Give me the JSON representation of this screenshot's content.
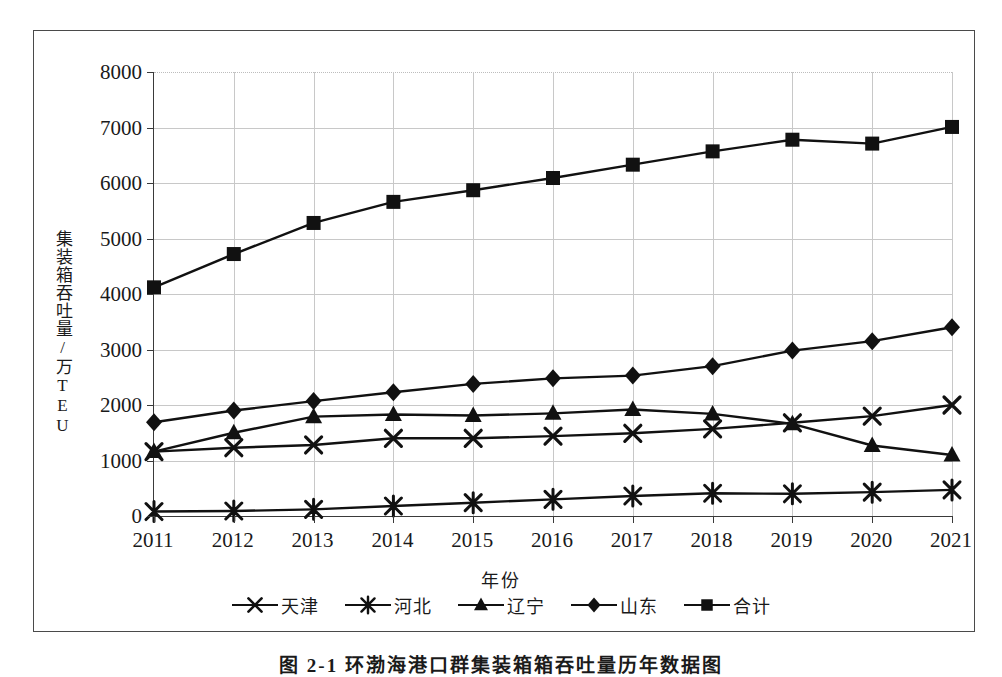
{
  "figure": {
    "caption": "图 2-1  环渤海港口群集装箱箱吞吐量历年数据图",
    "frame_color": "#4a4a4a",
    "plot_color": "#111111"
  },
  "chart_data": {
    "type": "line",
    "title": "",
    "xlabel": "年份",
    "ylabel": "集装箱吞吐量/万TEU",
    "grid": true,
    "legend_position": "bottom",
    "ylim": [
      0,
      8000
    ],
    "y_ticks": [
      0,
      1000,
      2000,
      3000,
      4000,
      5000,
      6000,
      7000,
      8000
    ],
    "y_tick_labels": [
      "0",
      "1000",
      "2000",
      "3000",
      "4000",
      "5000",
      "6000",
      "7000",
      "8000"
    ],
    "categories": [
      "2011",
      "2012",
      "2013",
      "2014",
      "2015",
      "2016",
      "2017",
      "2018",
      "2019",
      "2020",
      "2021"
    ],
    "series": [
      {
        "name": "天津",
        "marker": "x-cross",
        "values": [
          1160,
          1230,
          1280,
          1400,
          1400,
          1440,
          1490,
          1570,
          1680,
          1800,
          2000
        ]
      },
      {
        "name": "河北",
        "marker": "asterisk",
        "values": [
          80,
          90,
          120,
          180,
          240,
          300,
          360,
          410,
          400,
          430,
          470
        ]
      },
      {
        "name": "辽宁",
        "marker": "triangle",
        "values": [
          1160,
          1500,
          1790,
          1830,
          1810,
          1850,
          1920,
          1840,
          1660,
          1270,
          1100
        ]
      },
      {
        "name": "山东",
        "marker": "diamond",
        "values": [
          1690,
          1900,
          2070,
          2230,
          2380,
          2480,
          2530,
          2700,
          2980,
          3150,
          3400
        ]
      },
      {
        "name": "合计",
        "marker": "square",
        "values": [
          4120,
          4720,
          5280,
          5660,
          5870,
          6090,
          6330,
          6570,
          6780,
          6710,
          7010
        ]
      }
    ]
  }
}
